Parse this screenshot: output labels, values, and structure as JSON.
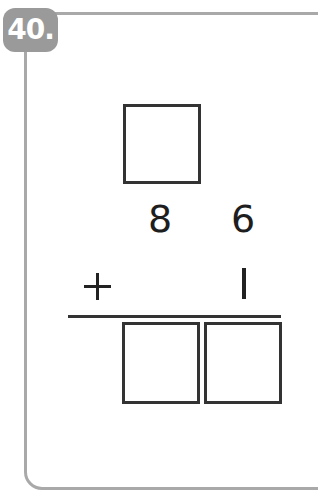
{
  "problem": {
    "number_label": "40.",
    "operation": "+",
    "top_answer_box": "",
    "addend1": {
      "tens": "8",
      "ones": "6"
    },
    "addend2": {
      "tens": "",
      "ones": "1"
    },
    "sum_boxes": [
      "",
      ""
    ]
  },
  "colors": {
    "badge": "#9a9a9a",
    "frame": "#a9a9a9",
    "ink": "#222222"
  }
}
